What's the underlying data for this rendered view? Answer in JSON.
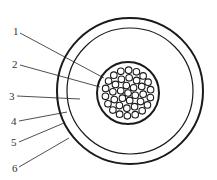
{
  "diagram": {
    "labels": [
      {
        "id": 1,
        "text": "1"
      },
      {
        "id": 2,
        "text": "2"
      },
      {
        "id": 3,
        "text": "3"
      },
      {
        "id": 4,
        "text": "4"
      },
      {
        "id": 5,
        "text": "5"
      },
      {
        "id": 6,
        "text": "6"
      }
    ],
    "strand_count": 37,
    "stroke_color": "#1a1a1a"
  }
}
